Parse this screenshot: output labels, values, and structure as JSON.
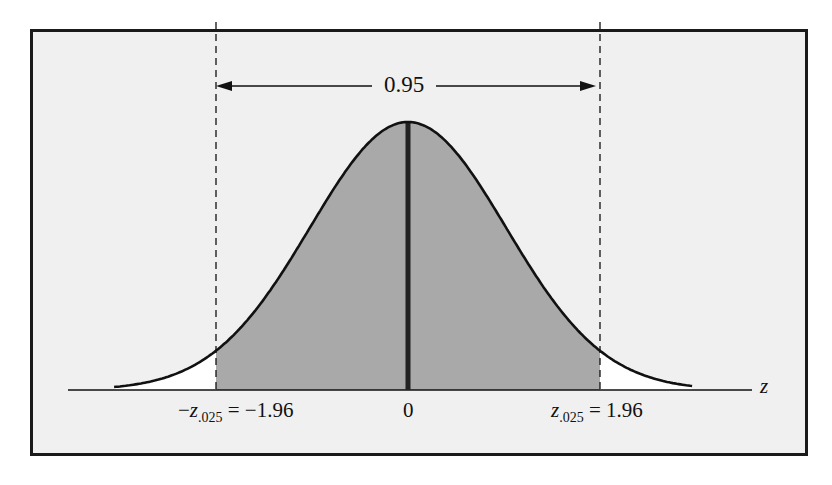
{
  "chart_data": {
    "type": "area",
    "title": "",
    "xlabel": "z",
    "ylabel": "",
    "xlim": [
      -3.2,
      3.0
    ],
    "distribution": {
      "name": "standard normal",
      "mean": 0,
      "sd": 1
    },
    "shaded_region": {
      "from": -1.96,
      "to": 1.96,
      "area": 0.95,
      "color": "#a9a9a9"
    },
    "unshaded_tails": {
      "left_area": 0.025,
      "right_area": 0.025,
      "color": "#ffffff"
    },
    "critical_values": [
      {
        "name": "-z.025",
        "value": -1.96
      },
      {
        "name": "z.025",
        "value": 1.96
      }
    ],
    "center_line": {
      "x": 0
    },
    "annotations": [
      {
        "text": "0.95",
        "type": "double-arrow",
        "from": -1.96,
        "to": 1.96
      }
    ],
    "tick_labels": [
      "-z.025 = -1.96",
      "0",
      "z.025 = 1.96"
    ],
    "grid": false,
    "legend": null
  },
  "labels": {
    "area": "0.95",
    "axis_var": "z",
    "left_prefix": "−",
    "left_var": "z",
    "left_sub": ".025",
    "left_eq": " = −1.96",
    "center": "0",
    "right_var": "z",
    "right_sub": ".025",
    "right_eq": " = 1.96"
  },
  "colors": {
    "frame_bg": "#f0f0f0",
    "shade": "#a9a9a9",
    "curve": "#111111"
  }
}
